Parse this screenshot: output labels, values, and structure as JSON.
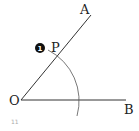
{
  "diagram": {
    "type": "angle-construction",
    "points": {
      "O": {
        "label": "O",
        "x": 21,
        "y": 100
      },
      "A": {
        "label": "A",
        "x": 90,
        "y": 14
      },
      "B": {
        "label": "B",
        "x": 125,
        "y": 100
      },
      "P": {
        "label": "P",
        "x": 57,
        "y": 57
      }
    },
    "marker": {
      "label": "1",
      "color": "#111111"
    },
    "footer_number": "11",
    "line_color": "#333333",
    "arc_color": "#555555"
  }
}
